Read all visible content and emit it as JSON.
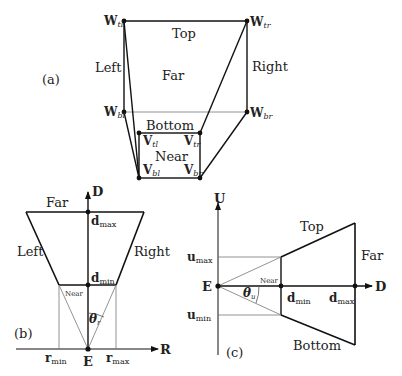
{
  "panel_a": {
    "tag": "(a)",
    "faces": {
      "top": "Top",
      "far": "Far",
      "left": "Left",
      "right": "Right",
      "bottom": "Bottom",
      "near": "Near"
    },
    "vertices": {
      "W_tl": {
        "base": "W",
        "sub": "tl"
      },
      "W_tr": {
        "base": "W",
        "sub": "tr"
      },
      "W_bl": {
        "base": "W",
        "sub": "bl"
      },
      "W_br": {
        "base": "W",
        "sub": "br"
      },
      "V_tl": {
        "base": "V",
        "sub": "tl"
      },
      "V_tr": {
        "base": "V",
        "sub": "tr"
      },
      "V_bl": {
        "base": "V",
        "sub": "bl"
      },
      "V_br": {
        "base": "V",
        "sub": "br"
      }
    }
  },
  "panel_b": {
    "tag": "(b)",
    "axis_vertical": "D",
    "axis_horizontal": "R",
    "origin": "E",
    "faces": {
      "far": "Far",
      "left": "Left",
      "right": "Right",
      "near": "Near"
    },
    "d_max": {
      "base": "d",
      "sub": "max"
    },
    "d_min": {
      "base": "d",
      "sub": "min"
    },
    "r_min": {
      "base": "r",
      "sub": "min"
    },
    "r_max": {
      "base": "r",
      "sub": "max"
    },
    "angle": {
      "base": "θ",
      "sub": "r"
    }
  },
  "panel_c": {
    "tag": "(c)",
    "axis_vertical": "U",
    "axis_horizontal": "D",
    "origin": "E",
    "faces": {
      "top": "Top",
      "far": "Far",
      "bottom": "Bottom",
      "near": "Near"
    },
    "u_max": {
      "base": "u",
      "sub": "max"
    },
    "u_min": {
      "base": "u",
      "sub": "min"
    },
    "d_min": {
      "base": "d",
      "sub": "min"
    },
    "d_max": {
      "base": "d",
      "sub": "max"
    },
    "angle": {
      "base": "θ",
      "sub": "u"
    }
  }
}
